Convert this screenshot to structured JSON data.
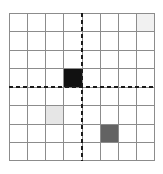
{
  "figure": {
    "title": "",
    "background_color": "#ffffff",
    "width": 163,
    "height": 174
  },
  "grid": {
    "columns": 8,
    "rows": 8,
    "plot_left": 9,
    "plot_top": 13,
    "plot_width": 146,
    "plot_height": 148,
    "cell_width": 18.25,
    "cell_height": 18.5,
    "line_color": "#8c8c8c",
    "line_width": 1,
    "border_color": "#8c8c8c",
    "cell_fill_default": "#ffffff"
  },
  "axes": {
    "style": "dashed",
    "color": "#1a1a1a",
    "line_width": 2,
    "dash_pattern": "4 3",
    "vertical_axis": {
      "name": "vertical-axis",
      "at_column_boundary": 4,
      "x": 73
    },
    "horizontal_axis": {
      "name": "horizontal-axis",
      "at_row_boundary": 4,
      "y": 74
    }
  },
  "cells": [
    {
      "name": "cell-black-marker",
      "row": 4,
      "col": 4,
      "color": "#111111",
      "label": "black",
      "quadrant": "upper-left"
    },
    {
      "name": "cell-light-gray-marker",
      "row": 6,
      "col": 3,
      "color": "#e6e6e6",
      "label": "light gray",
      "quadrant": "lower-left"
    },
    {
      "name": "cell-dark-gray-marker",
      "row": 7,
      "col": 6,
      "color": "#636363",
      "label": "dark gray",
      "quadrant": "lower-right"
    },
    {
      "name": "cell-faint-marker",
      "row": 1,
      "col": 8,
      "color": "#f1f1f1",
      "label": "very light gray",
      "quadrant": "upper-right"
    }
  ],
  "chart_data": {
    "type": "heatmap",
    "title": "",
    "xlabel": "",
    "ylabel": "",
    "grid": true,
    "legend": "none",
    "columns": 8,
    "rows": 8,
    "xlim": [
      0,
      8
    ],
    "ylim": [
      0,
      8
    ],
    "x_tick_labels": [],
    "y_tick_labels": [],
    "annotations": [
      "dashed vertical axis between column 4 and column 5",
      "dashed horizontal axis between row 4 and row 5"
    ],
    "values": [
      [
        0,
        0,
        0,
        0,
        0,
        0,
        0,
        0.06
      ],
      [
        0,
        0,
        0,
        0,
        0,
        0,
        0,
        0
      ],
      [
        0,
        0,
        0,
        0,
        0,
        0,
        0,
        0
      ],
      [
        0,
        0,
        0,
        1.0,
        0,
        0,
        0,
        0
      ],
      [
        0,
        0,
        0,
        0,
        0,
        0,
        0,
        0
      ],
      [
        0,
        0,
        0.1,
        0,
        0,
        0,
        0,
        0
      ],
      [
        0,
        0,
        0,
        0,
        0,
        0.61,
        0,
        0
      ],
      [
        0,
        0,
        0,
        0,
        0,
        0,
        0,
        0
      ]
    ],
    "value_colors": [
      [
        "#ffffff",
        "#ffffff",
        "#ffffff",
        "#ffffff",
        "#ffffff",
        "#ffffff",
        "#ffffff",
        "#f1f1f1"
      ],
      [
        "#ffffff",
        "#ffffff",
        "#ffffff",
        "#ffffff",
        "#ffffff",
        "#ffffff",
        "#ffffff",
        "#ffffff"
      ],
      [
        "#ffffff",
        "#ffffff",
        "#ffffff",
        "#ffffff",
        "#ffffff",
        "#ffffff",
        "#ffffff",
        "#ffffff"
      ],
      [
        "#ffffff",
        "#ffffff",
        "#ffffff",
        "#111111",
        "#ffffff",
        "#ffffff",
        "#ffffff",
        "#ffffff"
      ],
      [
        "#ffffff",
        "#ffffff",
        "#ffffff",
        "#ffffff",
        "#ffffff",
        "#ffffff",
        "#ffffff",
        "#ffffff"
      ],
      [
        "#ffffff",
        "#ffffff",
        "#e6e6e6",
        "#ffffff",
        "#ffffff",
        "#ffffff",
        "#ffffff",
        "#ffffff"
      ],
      [
        "#ffffff",
        "#ffffff",
        "#ffffff",
        "#ffffff",
        "#ffffff",
        "#636363",
        "#ffffff",
        "#ffffff"
      ],
      [
        "#ffffff",
        "#ffffff",
        "#ffffff",
        "#ffffff",
        "#ffffff",
        "#ffffff",
        "#ffffff",
        "#ffffff"
      ]
    ]
  }
}
